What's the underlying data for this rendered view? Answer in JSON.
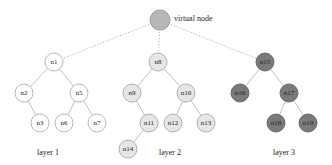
{
  "virtual_node": {
    "id": "v",
    "label": "virtual node",
    "x": 160,
    "y": 20,
    "r": 10,
    "fill": "#b8b8b8",
    "stroke": "#9a9a9a"
  },
  "layers": [
    {
      "caption": "layer 1",
      "caption_pos": {
        "x": 48,
        "y": 155
      },
      "fill": "#ffffff",
      "stroke": "#b8b8b8",
      "nodes": [
        {
          "id": "n1",
          "label": "n1",
          "x": 54,
          "y": 62
        },
        {
          "id": "n2",
          "label": "n2",
          "x": 24,
          "y": 93
        },
        {
          "id": "n5",
          "label": "n5",
          "x": 79,
          "y": 93
        },
        {
          "id": "n3",
          "label": "n3",
          "x": 40,
          "y": 123
        },
        {
          "id": "n6",
          "label": "n6",
          "x": 64,
          "y": 123
        },
        {
          "id": "n7",
          "label": "n7",
          "x": 97,
          "y": 123
        }
      ],
      "edges": [
        [
          "n1",
          "n2"
        ],
        [
          "n1",
          "n5"
        ],
        [
          "n2",
          "n3"
        ],
        [
          "n5",
          "n6"
        ],
        [
          "n5",
          "n7"
        ]
      ]
    },
    {
      "caption": "layer 2",
      "caption_pos": {
        "x": 170,
        "y": 155
      },
      "fill": "#e6e6e6",
      "stroke": "#b0b0b0",
      "nodes": [
        {
          "id": "n8",
          "label": "n8",
          "x": 158,
          "y": 62
        },
        {
          "id": "n9",
          "label": "n9",
          "x": 132,
          "y": 93
        },
        {
          "id": "n10",
          "label": "n10",
          "x": 186,
          "y": 93
        },
        {
          "id": "n11",
          "label": "n11",
          "x": 149,
          "y": 123
        },
        {
          "id": "n12",
          "label": "n12",
          "x": 173,
          "y": 123
        },
        {
          "id": "n13",
          "label": "n13",
          "x": 206,
          "y": 123
        },
        {
          "id": "n14",
          "label": "n14",
          "x": 128,
          "y": 149
        }
      ],
      "edges": [
        [
          "n8",
          "n9"
        ],
        [
          "n8",
          "n10"
        ],
        [
          "n9",
          "n11"
        ],
        [
          "n10",
          "n12"
        ],
        [
          "n10",
          "n13"
        ],
        [
          "n11",
          "n14"
        ]
      ]
    },
    {
      "caption": "layer 3",
      "caption_pos": {
        "x": 284,
        "y": 155
      },
      "fill": "#7a7a7a",
      "stroke": "#6a6a6a",
      "nodes": [
        {
          "id": "n15",
          "label": "n15",
          "x": 265,
          "y": 62
        },
        {
          "id": "n16",
          "label": "n16",
          "x": 240,
          "y": 93
        },
        {
          "id": "n17",
          "label": "n17",
          "x": 289,
          "y": 93
        },
        {
          "id": "n18",
          "label": "n18",
          "x": 276,
          "y": 123
        },
        {
          "id": "n19",
          "label": "n19",
          "x": 308,
          "y": 123
        }
      ],
      "edges": [
        [
          "n15",
          "n16"
        ],
        [
          "n15",
          "n17"
        ],
        [
          "n17",
          "n18"
        ],
        [
          "n17",
          "n19"
        ]
      ]
    }
  ],
  "virtual_edges": [
    [
      "v",
      "n1"
    ],
    [
      "v",
      "n8"
    ],
    [
      "v",
      "n15"
    ]
  ],
  "style": {
    "node_radius": 9,
    "edge_color": "#c0c0c0",
    "virtual_edge_color": "#b0b0b0"
  }
}
